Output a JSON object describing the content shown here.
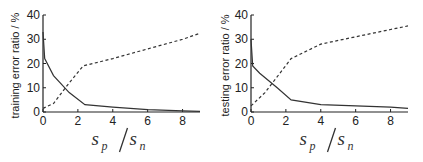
{
  "chart_data": [
    {
      "type": "line",
      "title": "",
      "xlabel": "s_p / s_n",
      "ylabel": "training error ratio / %",
      "xlim": [
        0,
        9
      ],
      "ylim": [
        0,
        40
      ],
      "xticks": [
        0,
        2,
        4,
        6,
        8
      ],
      "yticks": [
        0,
        10,
        20,
        30,
        40
      ],
      "grid": false,
      "legend": null,
      "series": [
        {
          "name": "solid",
          "style": "solid",
          "x": [
            0,
            0.1,
            0.6,
            1.5,
            2.4,
            4,
            6,
            8,
            9
          ],
          "y": [
            33,
            22,
            15,
            8,
            3,
            2,
            1,
            0.5,
            0.3
          ]
        },
        {
          "name": "dashed",
          "style": "dashed",
          "x": [
            0,
            0.6,
            1.5,
            2.3,
            4,
            6,
            8,
            9
          ],
          "y": [
            1.5,
            3.5,
            12,
            19,
            22,
            26,
            30,
            32.5
          ]
        }
      ]
    },
    {
      "type": "line",
      "title": "",
      "xlabel": "s_p / s_n",
      "ylabel": "testing error ratio / %",
      "xlim": [
        0,
        9
      ],
      "ylim": [
        0,
        40
      ],
      "xticks": [
        0,
        2,
        4,
        6,
        8
      ],
      "yticks": [
        0,
        10,
        20,
        30,
        40
      ],
      "grid": false,
      "legend": null,
      "series": [
        {
          "name": "solid",
          "style": "solid",
          "x": [
            0,
            0.1,
            0.5,
            1.5,
            2.3,
            4,
            6,
            8,
            9
          ],
          "y": [
            30,
            19,
            16,
            10,
            5,
            3,
            2.5,
            2,
            1.5
          ]
        },
        {
          "name": "dashed",
          "style": "dashed",
          "x": [
            0,
            0.8,
            2.3,
            4,
            6,
            8,
            9
          ],
          "y": [
            2.5,
            8,
            22,
            28,
            31,
            34,
            35.5
          ]
        }
      ]
    }
  ],
  "labels": {
    "left_ylabel": "training error ratio / %",
    "right_ylabel": "testing error ratio / %",
    "x_main_s": "s",
    "x_sub_p": "p",
    "x_sub_n": "n"
  }
}
